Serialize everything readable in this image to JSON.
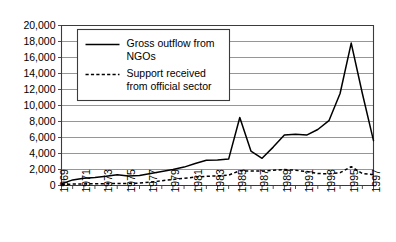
{
  "chart_data": {
    "type": "line",
    "title": "",
    "subtitle": "",
    "xlabel": "",
    "ylabel": "",
    "grid": true,
    "grid_axis": "y",
    "legend_position": "inside-top-left",
    "xlim": [
      1969,
      1997
    ],
    "ylim": [
      0,
      20000
    ],
    "ytick_step": 2000,
    "xtick_step_labeled": 2,
    "xtick_step_minor": 1,
    "x": [
      1969,
      1970,
      1971,
      1972,
      1973,
      1974,
      1975,
      1976,
      1977,
      1978,
      1979,
      1980,
      1981,
      1982,
      1983,
      1984,
      1985,
      1986,
      1987,
      1988,
      1989,
      1990,
      1991,
      1992,
      1993,
      1994,
      1995,
      1996,
      1997
    ],
    "x_tick_labels": [
      "1969",
      "1971",
      "1973",
      "1975",
      "1977",
      "1979",
      "1981",
      "1983",
      "1985",
      "1987",
      "1989",
      "1991",
      "1993",
      "1995",
      "1997"
    ],
    "y_tick_labels": [
      "0",
      "2,000",
      "4,000",
      "6,000",
      "8,000",
      "10,000",
      "12,000",
      "14,000",
      "16,000",
      "18,000",
      "20,000"
    ],
    "series": [
      {
        "name": "Gross outflow from NGOs",
        "style": "solid",
        "color": "#000000",
        "values": [
          200,
          700,
          900,
          1000,
          1150,
          1350,
          1200,
          1250,
          1500,
          1750,
          2000,
          2300,
          2750,
          3150,
          3200,
          3300,
          8500,
          4300,
          3400,
          4800,
          6300,
          6400,
          6300,
          7000,
          8100,
          11500,
          17800,
          11500,
          5600
        ]
      },
      {
        "name": "Support received from official sector",
        "style": "dashed",
        "color": "#000000",
        "values": [
          120,
          180,
          200,
          220,
          230,
          250,
          260,
          300,
          420,
          600,
          750,
          900,
          1050,
          1150,
          1200,
          1300,
          1850,
          1800,
          1800,
          1900,
          2000,
          1900,
          1750,
          1500,
          1450,
          1600,
          2350,
          1500,
          1350
        ]
      }
    ],
    "legend": [
      {
        "line1": "Gross outflow from",
        "line2": "NGOs",
        "style": "solid"
      },
      {
        "line1": "Support received",
        "line2": "from official sector",
        "style": "dashed"
      }
    ]
  }
}
